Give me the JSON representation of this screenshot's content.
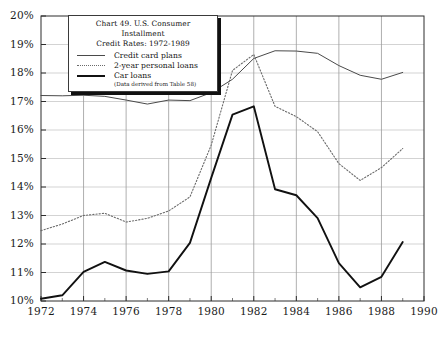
{
  "legend_box": {
    "title_line1": "Chart 49. U.S. Consumer Installment",
    "title_line2": "Credit Rates: 1972-1989",
    "note": "(Data derived from Table 58)",
    "entries": [
      {
        "label": "Credit card plans",
        "style": "thin-solid"
      },
      {
        "label": "2-year personal loans",
        "style": "dotted"
      },
      {
        "label": "Car loans",
        "style": "thick-solid"
      }
    ]
  },
  "chart_data": {
    "type": "line",
    "title": "Chart 49. U.S. Consumer Installment Credit Rates: 1972-1989",
    "xlabel": "",
    "ylabel": "",
    "xlim": [
      1972,
      1990
    ],
    "ylim": [
      10,
      20
    ],
    "grid": true,
    "legend_position": "top-left-inset",
    "x_ticks": [
      1972,
      1974,
      1976,
      1978,
      1980,
      1982,
      1984,
      1986,
      1988,
      1990
    ],
    "x_tick_labels": [
      "1972",
      "1974",
      "1976",
      "1978",
      "1980",
      "1982",
      "1984",
      "1986",
      "1988",
      "1990"
    ],
    "y_ticks": [
      10,
      11,
      12,
      13,
      14,
      15,
      16,
      17,
      18,
      19,
      20
    ],
    "y_tick_labels": [
      "10%",
      "11%",
      "12%",
      "13%",
      "14%",
      "15%",
      "16%",
      "17%",
      "18%",
      "19%",
      "20%"
    ],
    "x": [
      1972,
      1973,
      1974,
      1975,
      1976,
      1977,
      1978,
      1979,
      1980,
      1981,
      1982,
      1983,
      1984,
      1985,
      1986,
      1987,
      1988,
      1989
    ],
    "series": [
      {
        "name": "Credit card plans",
        "style": "thin-solid",
        "color": "#4a4a4a",
        "values": [
          17.21,
          17.2,
          17.22,
          17.18,
          17.05,
          16.91,
          17.05,
          17.03,
          17.31,
          17.78,
          18.51,
          18.78,
          18.77,
          18.69,
          18.26,
          17.92,
          17.78,
          18.02
        ]
      },
      {
        "name": "2-year personal loans",
        "style": "dotted",
        "color": "#6a6a6a",
        "values": [
          12.47,
          12.7,
          13.0,
          13.08,
          12.77,
          12.9,
          13.16,
          13.65,
          15.47,
          18.09,
          18.65,
          16.83,
          16.47,
          15.94,
          14.82,
          14.23,
          14.68,
          15.35
        ]
      },
      {
        "name": "Car loans",
        "style": "thick-solid",
        "color": "#111111",
        "values": [
          10.08,
          10.2,
          11.02,
          11.37,
          11.07,
          10.95,
          11.04,
          12.04,
          14.32,
          16.54,
          16.83,
          13.92,
          13.71,
          12.91,
          11.33,
          10.48,
          10.85,
          12.07
        ]
      }
    ]
  }
}
